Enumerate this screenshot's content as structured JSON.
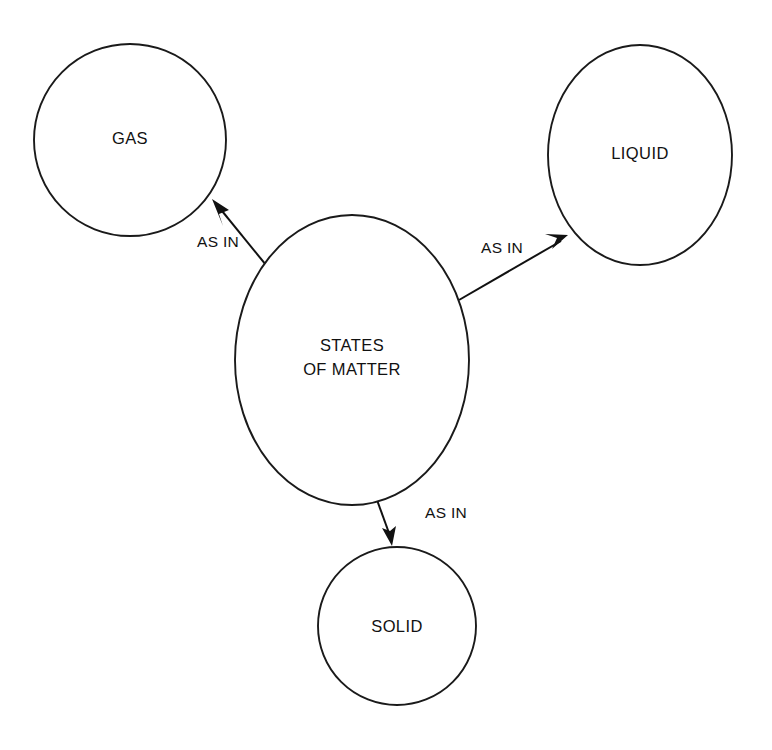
{
  "diagram": {
    "type": "concept-map",
    "background_color": "#ffffff",
    "stroke_color": "#1a1a1a",
    "text_color": "#111111",
    "nodes": [
      {
        "id": "center",
        "label_line1": "STATES",
        "label_line2": "OF MATTER",
        "shape": "ellipse",
        "cx": 352,
        "cy": 360,
        "rx": 117,
        "ry": 145
      },
      {
        "id": "gas",
        "label": "GAS",
        "shape": "circle",
        "cx": 130,
        "cy": 140,
        "rx": 96,
        "ry": 96
      },
      {
        "id": "liquid",
        "label": "LIQUID",
        "shape": "ellipse",
        "cx": 640,
        "cy": 155,
        "rx": 92,
        "ry": 110
      },
      {
        "id": "solid",
        "label": "SOLID",
        "shape": "circle",
        "cx": 397,
        "cy": 626,
        "rx": 79,
        "ry": 79
      }
    ],
    "edges": [
      {
        "id": "center-to-gas",
        "from": "center",
        "to": "gas",
        "label": "AS IN",
        "label_x": 218,
        "label_y": 243,
        "x1": 279,
        "y1": 281,
        "x2": 212,
        "y2": 199
      },
      {
        "id": "center-to-liquid",
        "from": "center",
        "to": "liquid",
        "label": "AS IN",
        "label_x": 502,
        "label_y": 249,
        "x1": 459,
        "y1": 300,
        "x2": 568,
        "y2": 235
      },
      {
        "id": "center-to-solid",
        "from": "center",
        "to": "solid",
        "label": "AS IN",
        "label_x": 446,
        "label_y": 514,
        "x1": 377,
        "y1": 500,
        "x2": 392,
        "y2": 545
      }
    ]
  }
}
